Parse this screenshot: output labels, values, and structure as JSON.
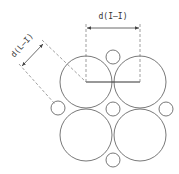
{
  "diagram": {
    "type": "circle-packing-dimension-diagram",
    "labels": {
      "horizontal_dimension": "d(I—I)",
      "diagonal_dimension": "d(L—I)"
    },
    "colors": {
      "stroke": "#555555",
      "background": "#ffffff"
    },
    "large_circles": [
      {
        "id": "top-left",
        "cx": 86,
        "cy": 82,
        "r": 26
      },
      {
        "id": "top-right",
        "cx": 140,
        "cy": 82,
        "r": 26
      },
      {
        "id": "bottom-left",
        "cx": 86,
        "cy": 135,
        "r": 26
      },
      {
        "id": "bottom-right",
        "cx": 140,
        "cy": 135,
        "r": 26
      }
    ],
    "small_circles": [
      {
        "id": "top",
        "cx": 113,
        "cy": 57,
        "r": 7
      },
      {
        "id": "center",
        "cx": 113,
        "cy": 109,
        "r": 7
      },
      {
        "id": "left",
        "cx": 58,
        "cy": 108,
        "r": 7
      },
      {
        "id": "right",
        "cx": 166,
        "cy": 109,
        "r": 7
      },
      {
        "id": "bottom",
        "cx": 113,
        "cy": 160,
        "r": 7
      }
    ]
  }
}
